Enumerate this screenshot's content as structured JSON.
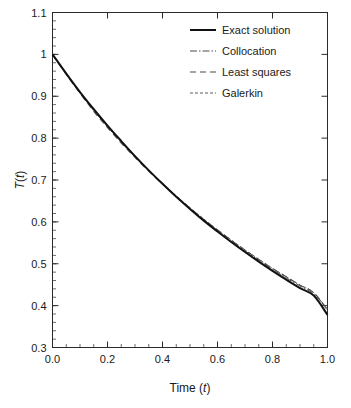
{
  "chart_data": {
    "type": "line",
    "title": "",
    "subtitle": "",
    "xlabel": "Time (t)",
    "xlabel_parts": {
      "text": "Time (",
      "italic": "t",
      "tail": ")"
    },
    "ylabel": "T(t)",
    "ylabel_parts": {
      "italic1": "T",
      "open": "(",
      "italic2": "t",
      "close": ")"
    },
    "xlim": [
      0.0,
      1.0
    ],
    "ylim": [
      0.3,
      1.1
    ],
    "xticks": [
      0.0,
      0.2,
      0.4,
      0.6,
      0.8,
      1.0
    ],
    "xtick_labels": [
      "0.0",
      "0.2",
      "0.4",
      "0.6",
      "0.8",
      "1.0"
    ],
    "yticks": [
      0.3,
      0.4,
      0.5,
      0.6,
      0.7,
      0.8,
      0.9,
      1.0,
      1.1
    ],
    "ytick_labels": [
      "0.3",
      "0.4",
      "0.5",
      "0.6",
      "0.7",
      "0.8",
      "0.9",
      "1",
      "1.1"
    ],
    "x_minor_step": 0.05,
    "y_minor_step": 0.02,
    "grid": false,
    "legend_position": "top-right",
    "x": [
      0.0,
      0.05,
      0.1,
      0.15,
      0.2,
      0.25,
      0.3,
      0.35,
      0.4,
      0.45,
      0.5,
      0.55,
      0.6,
      0.65,
      0.7,
      0.75,
      0.8,
      0.85,
      0.9,
      0.95,
      1.0
    ],
    "series": [
      {
        "name": "Exact solution",
        "style": "solid",
        "color": "#111111",
        "width": 2.0,
        "dash": "",
        "values": [
          1.0,
          0.954,
          0.91,
          0.869,
          0.83,
          0.793,
          0.757,
          0.723,
          0.691,
          0.66,
          0.631,
          0.603,
          0.577,
          0.552,
          0.528,
          0.505,
          0.483,
          0.462,
          0.442,
          0.424,
          0.378
        ]
      },
      {
        "name": "Collocation",
        "style": "dash-dot",
        "color": "#4a4a4a",
        "width": 1.0,
        "dash": "7 2 1.5 2",
        "values": [
          1.0,
          0.953,
          0.908,
          0.866,
          0.827,
          0.79,
          0.755,
          0.722,
          0.69,
          0.66,
          0.632,
          0.605,
          0.579,
          0.554,
          0.531,
          0.508,
          0.487,
          0.466,
          0.447,
          0.428,
          0.392
        ]
      },
      {
        "name": "Least squares",
        "style": "dashed",
        "color": "#4a4a4a",
        "width": 1.1,
        "dash": "6 4",
        "values": [
          1.0,
          0.952,
          0.907,
          0.864,
          0.825,
          0.788,
          0.754,
          0.721,
          0.69,
          0.661,
          0.633,
          0.606,
          0.581,
          0.556,
          0.533,
          0.51,
          0.489,
          0.469,
          0.449,
          0.431,
          0.39
        ]
      },
      {
        "name": "Galerkin",
        "style": "dotted",
        "color": "#4a4a4a",
        "width": 0.9,
        "dash": "3 2",
        "values": [
          1.0,
          0.954,
          0.909,
          0.867,
          0.828,
          0.792,
          0.757,
          0.724,
          0.692,
          0.662,
          0.634,
          0.607,
          0.581,
          0.557,
          0.533,
          0.511,
          0.489,
          0.469,
          0.449,
          0.431,
          0.388
        ]
      }
    ]
  },
  "legend": {
    "items": [
      {
        "label": "Exact solution"
      },
      {
        "label": "Collocation"
      },
      {
        "label": "Least squares"
      },
      {
        "label": "Galerkin"
      }
    ]
  },
  "colors": {
    "axis": "#2b2b2b",
    "text": "#1a1a1a",
    "exact": "#111111",
    "approx": "#4a4a4a",
    "background": "#ffffff"
  }
}
